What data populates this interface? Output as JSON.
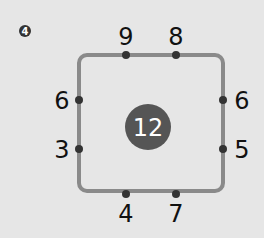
{
  "problem": {
    "number": "4",
    "center_value": "12",
    "colors": {
      "background": "#e6e6e6",
      "frame": "#8a8a8a",
      "dot": "#333333",
      "center_circle": "#555555",
      "badge": "#333333"
    },
    "top": [
      "9",
      "8"
    ],
    "left": [
      "6",
      "3"
    ],
    "right": [
      "6",
      "5"
    ],
    "bottom": [
      "4",
      "7"
    ]
  }
}
